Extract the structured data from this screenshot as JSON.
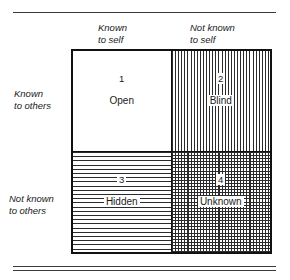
{
  "figure": {
    "columns": [
      {
        "id": "known-to-self",
        "label": "Known\nto self"
      },
      {
        "id": "not-known-to-self",
        "label": "Not known\nto self"
      }
    ],
    "rows": [
      {
        "id": "known-to-others",
        "label": "Known\nto others"
      },
      {
        "id": "not-known-to-others",
        "label": "Not known\nto others"
      }
    ],
    "quadrants": [
      {
        "id": "open",
        "number": "1",
        "name": "Open",
        "fill": "blank",
        "row": "known-to-others",
        "column": "known-to-self"
      },
      {
        "id": "blind",
        "number": "2",
        "name": "Blind",
        "fill": "vertical",
        "row": "known-to-others",
        "column": "not-known-to-self"
      },
      {
        "id": "hidden",
        "number": "3",
        "name": "Hidden",
        "fill": "horizontal",
        "row": "not-known-to-others",
        "column": "known-to-self"
      },
      {
        "id": "unknown",
        "number": "4",
        "name": "Unknown",
        "fill": "cross",
        "row": "not-known-to-others",
        "column": "not-known-to-self"
      }
    ],
    "colors": {
      "line": "#111111",
      "hatch": "#2b2b2b",
      "rule": "#3a3a3a",
      "background": "#ffffff",
      "text": "#1a1a1a"
    }
  }
}
